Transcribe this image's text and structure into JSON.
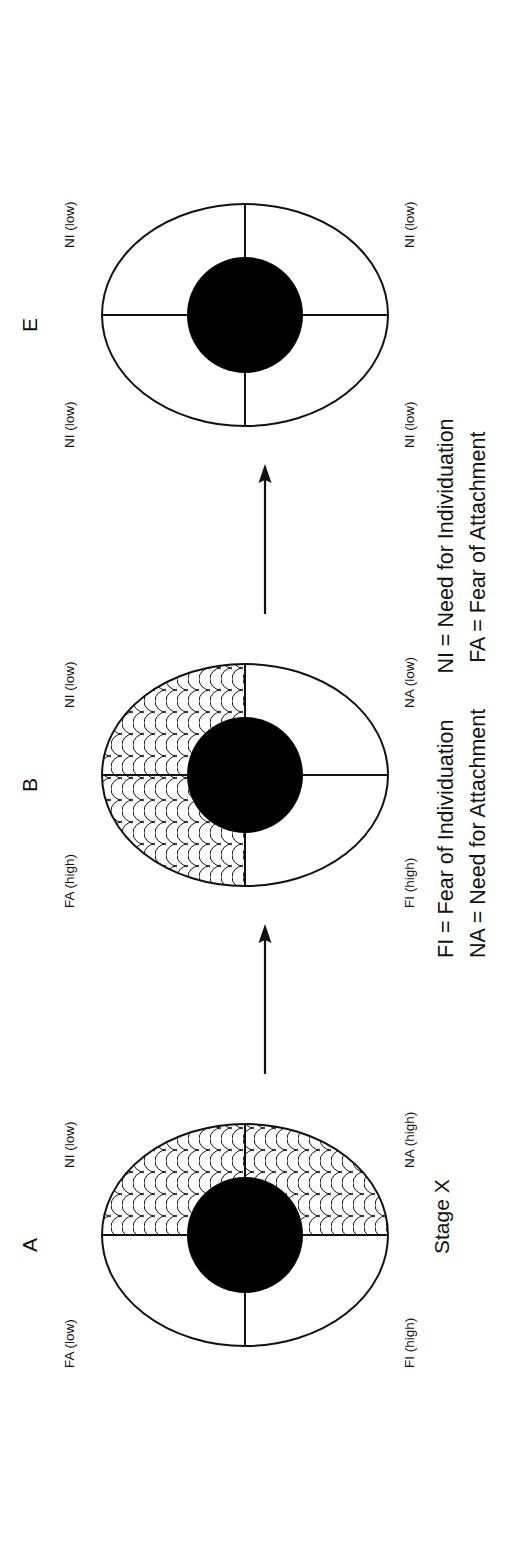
{
  "figure": {
    "stage_label": "Stage X",
    "panels": [
      {
        "id": "A",
        "letter": "A",
        "labels": {
          "top_left": "FA (low)",
          "bottom_left": "NI (low)",
          "top_right": "FI (high)",
          "bottom_right": "NA (high)"
        },
        "shaded_quadrants": [
          "top-right",
          "bottom-right"
        ],
        "shade_pattern": "fish-scale"
      },
      {
        "id": "B",
        "letter": "B",
        "labels": {
          "top_left": "FA (high)",
          "bottom_left": "NI (low)",
          "top_right": "FI (high)",
          "bottom_right": "NA (low)"
        },
        "shaded_quadrants": [
          "top-left",
          "top-right"
        ],
        "shade_pattern": "fish-scale"
      },
      {
        "id": "E",
        "letter": "E",
        "labels": {
          "top_left": "NI (low)",
          "bottom_left": "NI (low)",
          "top_right": "NI (low)",
          "bottom_right": "NI (low)"
        },
        "shaded_quadrants": [],
        "shade_pattern": "none"
      }
    ],
    "arrows": [
      {
        "from": "A",
        "to": "B",
        "direction": "right"
      },
      {
        "from": "B",
        "to": "E",
        "direction": "right"
      }
    ],
    "legend": {
      "line1_left": "FI = Fear of Individuation",
      "line1_right": "NI = Need for Individuation",
      "line2_left": "NA = Need for Attachment",
      "line2_right": "FA = Fear of Attachment"
    },
    "colors": {
      "ink": "#111111",
      "core_fill": "#000000",
      "background": "#ffffff"
    }
  }
}
